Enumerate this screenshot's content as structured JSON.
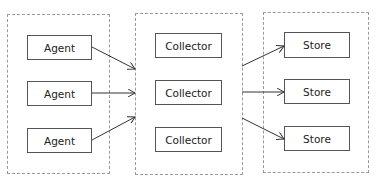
{
  "diagram": {
    "groups": [
      {
        "name": "agents-group",
        "nodes": [
          "Agent",
          "Agent",
          "Agent"
        ]
      },
      {
        "name": "collectors-group",
        "nodes": [
          "Collector",
          "Collector",
          "Collector"
        ]
      },
      {
        "name": "stores-group",
        "nodes": [
          "Store",
          "Store",
          "Store"
        ]
      }
    ],
    "edges": [
      {
        "from": "Agent 1",
        "to": "Collector 2"
      },
      {
        "from": "Agent 2",
        "to": "Collector 2"
      },
      {
        "from": "Agent 3",
        "to": "Collector 2"
      },
      {
        "from": "Collector 2",
        "to": "Store 1"
      },
      {
        "from": "Collector 2",
        "to": "Store 2"
      },
      {
        "from": "Collector 2",
        "to": "Store 3"
      }
    ],
    "colors": {
      "border": "#555555",
      "group_border": "#9a9a9a",
      "arrow": "#333333"
    }
  }
}
